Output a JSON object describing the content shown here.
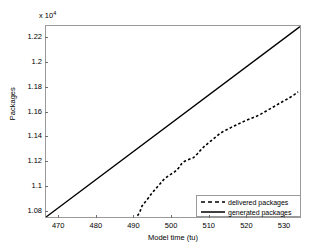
{
  "chart_data": {
    "type": "line",
    "title": "",
    "xlabel": "Model time (tu)",
    "ylabel": "Packages",
    "y_exponent_label": "x 10",
    "y_exponent_power": "4",
    "y_scale": 10000,
    "xlim": [
      466.5,
      534.5
    ],
    "ylim": [
      10740,
      12300
    ],
    "grid": false,
    "legend_position": "lower right",
    "xticks": [
      470,
      480,
      490,
      500,
      510,
      520,
      530
    ],
    "xtick_labels": [
      "470",
      "480",
      "490",
      "500",
      "510",
      "520",
      "530"
    ],
    "yticks": [
      10800,
      11000,
      11200,
      11400,
      11600,
      11800,
      12000,
      12200
    ],
    "ytick_labels": [
      "1.08",
      "1.1",
      "1.12",
      "1.14",
      "1.16",
      "1.18",
      "1.2",
      "1.22"
    ],
    "series": [
      {
        "name": "delivered packages",
        "style": "dashed",
        "color": "#000000",
        "x": [
          491.0,
          491.6,
          492.2,
          493.0,
          494.0,
          495.0,
          496.0,
          497.0,
          498.0,
          499.0,
          500.0,
          501.0,
          502.0,
          502.8,
          503.6,
          504.4,
          505.2,
          506.0,
          507.0,
          508.0,
          509.0,
          510.0,
          511.0,
          512.0,
          513.0,
          514.0,
          515.0,
          516.0,
          517.0,
          518.0,
          519.0,
          520.0,
          521.0,
          522.0,
          523.0,
          524.0,
          525.0,
          526.0,
          527.0,
          528.0,
          529.0,
          530.0,
          531.0,
          532.0,
          533.0,
          534.0
        ],
        "y": [
          10750,
          10780,
          10830,
          10860,
          10900,
          10940,
          10975,
          11010,
          11045,
          11070,
          11090,
          11110,
          11140,
          11175,
          11195,
          11205,
          11215,
          11225,
          11255,
          11290,
          11320,
          11345,
          11370,
          11395,
          11420,
          11440,
          11455,
          11470,
          11485,
          11500,
          11515,
          11528,
          11540,
          11552,
          11565,
          11580,
          11598,
          11615,
          11632,
          11650,
          11668,
          11685,
          11702,
          11720,
          11740,
          11762
        ]
      },
      {
        "name": "generated packages",
        "style": "solid",
        "color": "#000000",
        "x": [
          466.5,
          534.5
        ],
        "y": [
          10740,
          12295
        ]
      }
    ]
  },
  "legend": {
    "items": [
      {
        "label": "delivered packages",
        "style": "dashed"
      },
      {
        "label": "generated packages",
        "style": "solid"
      }
    ]
  }
}
